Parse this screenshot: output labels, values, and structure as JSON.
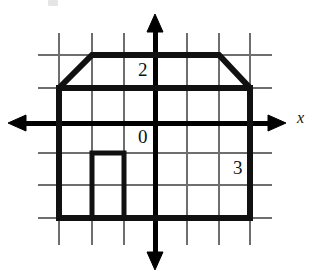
{
  "figure": {
    "background_color": "#ffffff",
    "ink_color": "#000000",
    "grid_color": "#6e6e6e"
  },
  "labels": {
    "two": "2",
    "zero": "0",
    "three": "3",
    "x_axis": "x"
  },
  "chart_data": {
    "type": "scatter",
    "title": "",
    "xlabel": "x",
    "ylabel": "",
    "grid": true,
    "legend": null,
    "axes": {
      "x_axis_label": "x",
      "x_axis_arrows": "both",
      "y_axis_arrows": "both",
      "origin_label": "0",
      "unit_px": 32,
      "origin_px": {
        "x": 155,
        "y": 123
      },
      "x_range_units": [
        -3,
        3.7
      ],
      "y_range_units": [
        -3,
        2.8
      ]
    },
    "gridlines": {
      "vertical_px": [
        59,
        92,
        124,
        155,
        187,
        219,
        250
      ],
      "horizontal_px": [
        55,
        88,
        123,
        153,
        185,
        218
      ],
      "vertical_units": [
        -3,
        -2,
        -1,
        0,
        1,
        2,
        3
      ],
      "horizontal_units": [
        2,
        1,
        0,
        -1,
        -2,
        -3
      ],
      "extent_px": {
        "left": 38,
        "right": 272,
        "top": 33,
        "bottom": 245
      }
    },
    "annotations": [
      {
        "text": "2",
        "x_units": -0.4,
        "y_units": 1.6
      },
      {
        "text": "0",
        "x_units": -0.4,
        "y_units": -0.5
      },
      {
        "text": "3",
        "x_units": 2.4,
        "y_units": -1.5
      }
    ],
    "shapes": [
      {
        "name": "house-outline",
        "kind": "polygon",
        "closed": true,
        "stroke_width_px": 6,
        "fill": "none",
        "vertices_units": [
          [
            -3,
            1
          ],
          [
            -2,
            2
          ],
          [
            2,
            2
          ],
          [
            3,
            1
          ],
          [
            3,
            -3
          ],
          [
            -3,
            -3
          ]
        ],
        "vertices_px": [
          [
            59,
            88
          ],
          [
            92,
            55
          ],
          [
            219,
            55
          ],
          [
            250,
            88
          ],
          [
            250,
            218
          ],
          [
            59,
            218
          ]
        ]
      },
      {
        "name": "house-door",
        "kind": "polyline",
        "closed": false,
        "stroke_width_px": 5,
        "fill": "none",
        "vertices_units": [
          [
            -2,
            -3
          ],
          [
            -2,
            -1
          ],
          [
            -1,
            -1
          ],
          [
            -1,
            -3
          ]
        ],
        "vertices_px": [
          [
            92,
            218
          ],
          [
            92,
            153
          ],
          [
            124,
            153
          ],
          [
            124,
            218
          ]
        ]
      }
    ]
  }
}
